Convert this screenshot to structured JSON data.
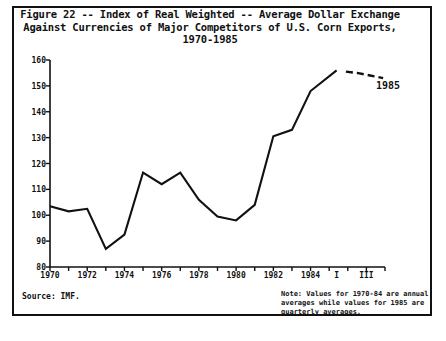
{
  "figure": {
    "title_line1": "Figure 22 -- Index of Real Weighted -- Average Dollar Exchange",
    "title_line2": "Against Currencies of Major Competitors of U.S. Corn Exports,",
    "title_line3": "1970-1985",
    "source": "Source:   IMF.",
    "note": "Note:   Values for 1970-84 are annual averages while values for 1985 are quarterly averages.",
    "annotation_1985": "1985"
  },
  "chart_data": {
    "type": "line",
    "title": "Figure 22 -- Index of Real Weighted -- Average Dollar Exchange Against Currencies of Major Competitors of U.S. Corn Exports, 1970-1985",
    "xlabel": "",
    "ylabel": "April, 1971 = 100",
    "ylim": [
      80,
      160
    ],
    "ytick_values": [
      80,
      90,
      100,
      110,
      120,
      130,
      140,
      150,
      160
    ],
    "ytick_labels": [
      "80",
      "90",
      "100",
      "110",
      "120",
      "130",
      "140",
      "150",
      "160"
    ],
    "xtick_labels": [
      "1970",
      "1972",
      "1974",
      "1976",
      "1978",
      "1980",
      "1982",
      "1984",
      "I",
      "III"
    ],
    "grid": false,
    "legend": "none",
    "series": [
      {
        "name": "Annual averages 1970-1984",
        "style": "solid",
        "x": [
          "1970",
          "1971",
          "1972",
          "1973",
          "1974",
          "1975",
          "1976",
          "1977",
          "1978",
          "1979",
          "1980",
          "1981",
          "1982",
          "1983",
          "1984",
          "1985-I"
        ],
        "values": [
          103.5,
          101.5,
          102.5,
          87.0,
          92.5,
          116.5,
          112.0,
          116.5,
          106.0,
          99.5,
          98.0,
          104.0,
          130.5,
          133.0,
          148.0,
          156.0
        ]
      },
      {
        "name": "Quarterly averages 1985",
        "style": "dashed",
        "x": [
          "1985-I",
          "1985-II",
          "1985-III",
          "1985-IV"
        ],
        "values": [
          155.5,
          155.0,
          154.0,
          153.0
        ]
      }
    ]
  }
}
